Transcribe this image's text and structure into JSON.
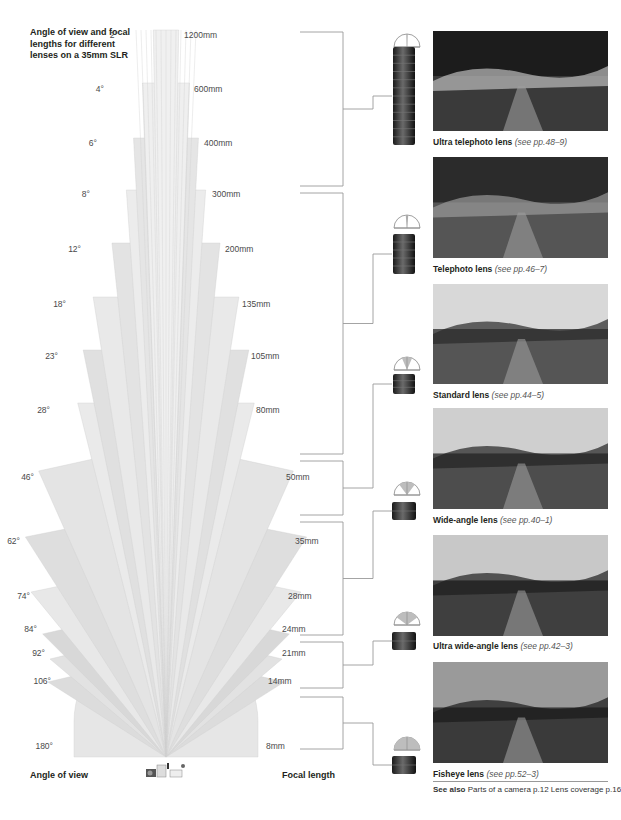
{
  "title": "Angle of view and focal lengths for different lenses on a 35mm SLR",
  "axis": {
    "left_label": "Angle of view",
    "right_label": "Focal length"
  },
  "colors": {
    "wedge_light": "#eeeeee",
    "wedge_mid": "#dcdcdc",
    "wedge_dark": "#c8c8c8",
    "bracket": "#9a9a9a",
    "text": "#231f20"
  },
  "fan": {
    "apex": [
      166,
      757
    ],
    "lenses": [
      {
        "angle": "2°",
        "deg": 2,
        "focal": "1200mm",
        "top_y": 30,
        "label_y": 35
      },
      {
        "angle": "4°",
        "deg": 4,
        "focal": "600mm",
        "top_y": 83,
        "label_y": 89
      },
      {
        "angle": "6°",
        "deg": 6,
        "focal": "400mm",
        "top_y": 138,
        "label_y": 143
      },
      {
        "angle": "8°",
        "deg": 8,
        "focal": "300mm",
        "top_y": 190,
        "label_y": 194
      },
      {
        "angle": "12°",
        "deg": 12,
        "focal": "200mm",
        "top_y": 243,
        "label_y": 249
      },
      {
        "angle": "18°",
        "deg": 18,
        "focal": "135mm",
        "top_y": 297,
        "label_y": 304
      },
      {
        "angle": "23°",
        "deg": 23,
        "focal": "105mm",
        "top_y": 350,
        "label_y": 356
      },
      {
        "angle": "28°",
        "deg": 28,
        "focal": "80mm",
        "top_y": 403,
        "label_y": 410
      },
      {
        "angle": "46°",
        "deg": 46,
        "focal": "50mm",
        "top_y": 457,
        "label_y": 477
      },
      {
        "angle": "62°",
        "deg": 62,
        "focal": "35mm",
        "top_y": 523,
        "label_y": 541
      },
      {
        "angle": "74°",
        "deg": 74,
        "focal": "28mm",
        "top_y": 578,
        "label_y": 596
      },
      {
        "angle": "84°",
        "deg": 84,
        "focal": "24mm",
        "top_y": 620,
        "label_y": 629
      },
      {
        "angle": "92°",
        "deg": 92,
        "focal": "21mm",
        "top_y": 645,
        "label_y": 653
      },
      {
        "angle": "106°",
        "deg": 106,
        "focal": "14mm",
        "top_y": 668,
        "label_y": 681
      },
      {
        "angle": "180°",
        "deg": 180,
        "focal": "8mm",
        "top_y": 745,
        "label_y": 746
      }
    ]
  },
  "categories": [
    {
      "name": "Ultra telephoto lens",
      "ref": "(see pp.48–9)",
      "photo_top": 31,
      "photo_h": 100,
      "caption_y": 137,
      "bracket": [
        32,
        186
      ],
      "icon_y": 33,
      "lens_y": 47,
      "lens_h": 98,
      "lens_w": 22,
      "fov": 4
    },
    {
      "name": "Telephoto lens",
      "ref": "(see pp.46–7)",
      "photo_top": 157,
      "photo_h": 101,
      "caption_y": 264,
      "bracket": [
        193,
        454
      ],
      "icon_y": 214,
      "lens_y": 234,
      "lens_h": 40,
      "lens_w": 22,
      "fov": 12
    },
    {
      "name": "Standard lens",
      "ref": "(see pp.44–5)",
      "photo_top": 284,
      "photo_h": 100,
      "caption_y": 390,
      "bracket": [
        461,
        515
      ],
      "icon_y": 356,
      "lens_y": 374,
      "lens_h": 20,
      "lens_w": 22,
      "fov": 46
    },
    {
      "name": "Wide-angle lens",
      "ref": "(see pp.40–1)",
      "photo_top": 408,
      "photo_h": 101,
      "caption_y": 515,
      "bracket": [
        522,
        635
      ],
      "icon_y": 481,
      "lens_y": 502,
      "lens_h": 18,
      "lens_w": 24,
      "fov": 74
    },
    {
      "name": "Ultra wide-angle lens",
      "ref": "(see pp.42–3)",
      "photo_top": 535,
      "photo_h": 101,
      "caption_y": 641,
      "bracket": [
        642,
        688
      ],
      "icon_y": 611,
      "lens_y": 632,
      "lens_h": 18,
      "lens_w": 24,
      "fov": 106
    },
    {
      "name": "Fisheye lens",
      "ref": "(see pp.52–3)",
      "photo_top": 662,
      "photo_h": 101,
      "caption_y": 769,
      "bracket": [
        697,
        749
      ],
      "icon_y": 736,
      "lens_y": 756,
      "lens_h": 18,
      "lens_w": 24,
      "fov": 180
    }
  ],
  "see_also": {
    "label": "See also",
    "text": "Parts of a camera p.12  Lens coverage p.16"
  }
}
